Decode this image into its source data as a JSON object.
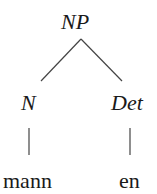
{
  "tree": {
    "root": {
      "label": "NP"
    },
    "children": [
      {
        "label": "N",
        "word": "mann"
      },
      {
        "label": "Det",
        "word": "en"
      }
    ]
  },
  "colors": {
    "text": "#1a1a1a",
    "edge": "#444444",
    "background": "#ffffff"
  }
}
